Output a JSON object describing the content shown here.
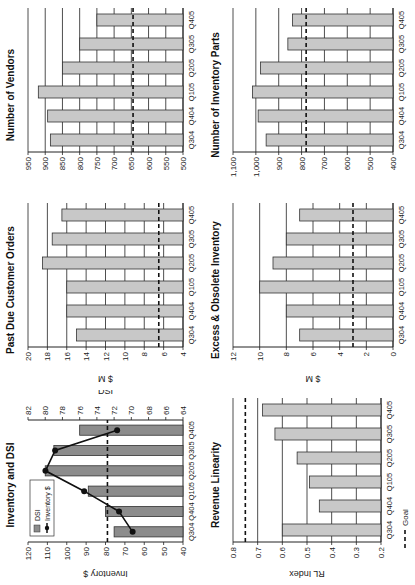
{
  "page": {
    "orientation": "rotated-90-counterclockwise"
  },
  "colors": {
    "bar_light": "#c8c8c8",
    "bar_dark": "#8c8c8c",
    "line": "#111111",
    "grid": "#222222",
    "goal": "#111111"
  },
  "panels": [
    {
      "id": "inventory",
      "title": "Inventory and DSI"
    },
    {
      "id": "pastdue",
      "title": "Past Due Customer Orders"
    },
    {
      "id": "vendors",
      "title": "Number of Vendors"
    },
    {
      "id": "revlin",
      "title": "Revenue Linearity"
    },
    {
      "id": "eo",
      "title": "Excess & Obsolete Inventory"
    },
    {
      "id": "parts",
      "title": "Number of Inventory Parts"
    }
  ],
  "legend": {
    "dsi": "DSI",
    "inventory": "Inventory $",
    "goal": "Goal"
  },
  "chart_data": [
    {
      "type": "bar+line",
      "title": "Inventory and DSI",
      "categories": [
        "Q304",
        "Q404",
        "Q105",
        "Q205",
        "Q305",
        "Q405"
      ],
      "series": [
        {
          "name": "DSI",
          "type": "bar",
          "axis": "right",
          "values": [
            72,
            73,
            75,
            80,
            79,
            76
          ]
        },
        {
          "name": "Inventory $",
          "type": "line",
          "axis": "left",
          "values": [
            66,
            73,
            91,
            111,
            106,
            74
          ]
        }
      ],
      "goal": 79,
      "ylabel": "Inventory $",
      "ylim": [
        40,
        120
      ],
      "yticks": [
        40,
        50,
        60,
        70,
        80,
        90,
        100,
        110,
        120
      ],
      "y2label": "DSI",
      "y2lim": [
        64,
        82
      ],
      "y2ticks": [
        64,
        66,
        68,
        70,
        72,
        74,
        76,
        78,
        80,
        82
      ],
      "legend_position": "top-left"
    },
    {
      "type": "bar",
      "title": "Past Due Customer Orders",
      "categories": [
        "Q304",
        "Q404",
        "Q105",
        "Q205",
        "Q305",
        "Q405"
      ],
      "values": [
        15,
        16,
        16,
        18.5,
        17.5,
        16.5
      ],
      "goal": 6.5,
      "ylabel": "$ M",
      "ylim": [
        4,
        20
      ],
      "yticks": [
        4,
        6,
        8,
        10,
        12,
        14,
        16,
        18,
        20
      ]
    },
    {
      "type": "bar",
      "title": "Number of Vendors",
      "categories": [
        "Q304",
        "Q404",
        "Q105",
        "Q205",
        "Q305",
        "Q405"
      ],
      "values": [
        885,
        893,
        920,
        850,
        800,
        750
      ],
      "goal": 645,
      "ylabel": "",
      "ylim": [
        500,
        950
      ],
      "yticks": [
        500,
        550,
        600,
        650,
        700,
        750,
        800,
        850,
        900,
        950
      ]
    },
    {
      "type": "bar",
      "title": "Revenue Linearity",
      "categories": [
        "Q304",
        "Q404",
        "Q105",
        "Q205",
        "Q305",
        "Q405"
      ],
      "values": [
        0.6,
        0.45,
        0.49,
        0.54,
        0.63,
        0.68
      ],
      "goal": 0.75,
      "ylabel": "RL Index",
      "ylim": [
        0.2,
        0.8
      ],
      "yticks": [
        0.2,
        0.3,
        0.4,
        0.5,
        0.6,
        0.7,
        0.8
      ],
      "legend": "Goal"
    },
    {
      "type": "bar",
      "title": "Excess & Obsolete Inventory",
      "categories": [
        "Q304",
        "Q404",
        "Q105",
        "Q205",
        "Q305",
        "Q405"
      ],
      "values": [
        7,
        8,
        10,
        9,
        8,
        7
      ],
      "goal": 3,
      "ylabel": "$ M",
      "ylim": [
        0,
        12
      ],
      "yticks": [
        0,
        2,
        4,
        6,
        8,
        10,
        12
      ]
    },
    {
      "type": "bar",
      "title": "Number of Inventory Parts",
      "categories": [
        "Q304",
        "Q404",
        "Q105",
        "Q205",
        "Q305",
        "Q405"
      ],
      "values": [
        955,
        990,
        1015,
        980,
        860,
        840
      ],
      "goal": 780,
      "ylabel": "",
      "ylim": [
        400,
        1100
      ],
      "yticks": [
        400,
        500,
        600,
        700,
        800,
        900,
        1000,
        1100
      ],
      "ytick_labels": [
        "400",
        "500",
        "600",
        "700",
        "800",
        "900",
        "1,000",
        "1,100"
      ]
    }
  ]
}
